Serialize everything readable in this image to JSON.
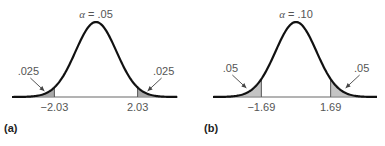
{
  "chart_data": [
    {
      "type": "area",
      "panel_label": "(a)",
      "title_symbol": "α",
      "title_eq": "= .05",
      "alpha": 0.05,
      "distribution": "t (two-tailed)",
      "critical_values": [
        -2.03,
        2.03
      ],
      "critical_labels": [
        "−2.03",
        "2.03"
      ],
      "tail_areas": [
        0.025,
        0.025
      ],
      "tail_labels": [
        ".025",
        ".025"
      ],
      "x_range": [
        -4,
        4
      ],
      "fill_color": "#a9a9a9",
      "curve_color": "#111111"
    },
    {
      "type": "area",
      "panel_label": "(b)",
      "title_symbol": "α",
      "title_eq": "= .10",
      "alpha": 0.1,
      "distribution": "t (two-tailed)",
      "critical_values": [
        -1.69,
        1.69
      ],
      "critical_labels": [
        "−1.69",
        "1.69"
      ],
      "tail_areas": [
        0.05,
        0.05
      ],
      "tail_labels": [
        ".05",
        ".05"
      ],
      "x_range": [
        -4,
        4
      ],
      "fill_color": "#c4c4c4",
      "curve_color": "#111111"
    }
  ]
}
